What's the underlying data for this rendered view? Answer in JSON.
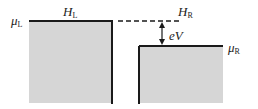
{
  "diagram": {
    "labels": {
      "mu_left": {
        "main": "μ",
        "sub": "L"
      },
      "h_left": {
        "main": "H",
        "sub": "L"
      },
      "h_right": {
        "main": "H",
        "sub": "R"
      },
      "mu_right": {
        "main": "μ",
        "sub": "R"
      },
      "bias": "eV"
    },
    "colors": {
      "fill": "#d6d6d6",
      "edge": "#1a1a1a"
    }
  }
}
